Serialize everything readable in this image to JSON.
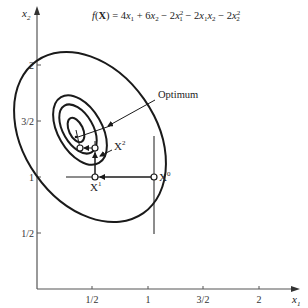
{
  "title_equation": {
    "lhs": "f(X) = ",
    "rhs_text": "4x₁ + 6x₂ − 2x₁² − 2x₁x₂ − 2x₂²"
  },
  "axes": {
    "x_label": "x",
    "x_sub": "1",
    "y_label": "x",
    "y_sub": "2",
    "x_ticks": [
      "1/2",
      "1",
      "3/2",
      "2"
    ],
    "y_ticks": [
      "1/2",
      "1",
      "3/2",
      "2"
    ]
  },
  "annotations": {
    "optimum": "Optimum",
    "x0": "X",
    "x0_sup": "0",
    "x1": "X",
    "x1_sup": "1",
    "x2": "X",
    "x2_sup": "2"
  },
  "colors": {
    "ink": "#1a1a1a",
    "axis": "#555555",
    "background": "#ffffff"
  }
}
